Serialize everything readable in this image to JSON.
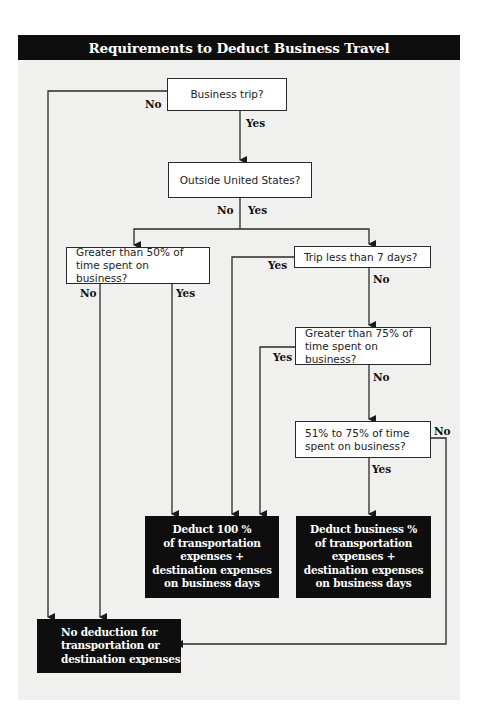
{
  "title": "Requirements to Deduct Business Travel",
  "colors": {
    "title_bg": "#0e0e0e",
    "panel_bg": "#f0f0ef",
    "line": "#2a2a2a",
    "result_bg": "#0e0e0e"
  },
  "questions": {
    "business_trip": "Business trip?",
    "outside_us": "Outside United States?",
    "gt50_line1": "Greater than 50% of",
    "gt50_line2": "time spent on business?",
    "lt7days": "Trip less than 7 days?",
    "gt75_line1": "Greater than 75% of",
    "gt75_line2": "time spent on business?",
    "r51to75_line1": "51% to 75% of time",
    "r51to75_line2": "spent on business?"
  },
  "labels": {
    "business_trip_no": "No",
    "business_trip_yes": "Yes",
    "outside_us_no": "No",
    "outside_us_yes": "Yes",
    "gt50_no": "No",
    "gt50_yes": "Yes",
    "lt7days_yes": "Yes",
    "lt7days_no": "No",
    "gt75_yes": "Yes",
    "gt75_no": "No",
    "r51to75_no": "No",
    "r51to75_yes": "Yes"
  },
  "results": {
    "deduct_100": [
      "Deduct 100 %",
      "of transportation",
      "expenses +",
      "destination expenses",
      "on business days"
    ],
    "deduct_business_pct": [
      "Deduct business %",
      "of transportation",
      "expenses +",
      "destination expenses",
      "on business days"
    ],
    "no_deduction": [
      "No deduction for",
      "transportation or",
      "destination expenses"
    ]
  }
}
